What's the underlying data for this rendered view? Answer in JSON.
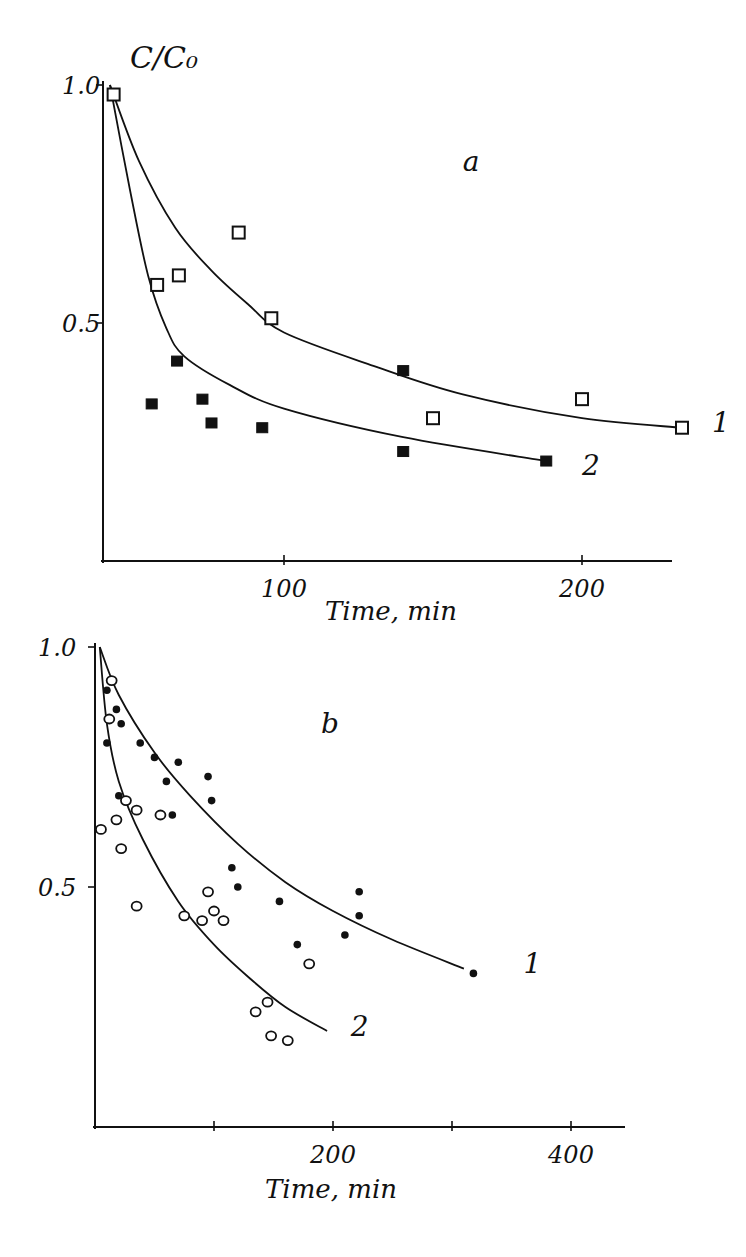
{
  "chart_data": [
    {
      "panel_label": "a",
      "type": "scatter",
      "title": "",
      "ylabel": "C/C₀",
      "xlabel": "Time, min",
      "xlim": [
        0,
        240
      ],
      "ylim": [
        0,
        1.0
      ],
      "x_ticks": [
        100,
        200
      ],
      "x_tick_labels": [
        "100",
        "200"
      ],
      "y_ticks": [
        0.5,
        1.0
      ],
      "y_tick_labels": [
        "0.5",
        "1.0"
      ],
      "grid": false,
      "series": [
        {
          "name": "1",
          "marker": "open-square",
          "points": [
            [
              6,
              0.98
            ],
            [
              30,
              0.58
            ],
            [
              42,
              0.6
            ],
            [
              75,
              0.69
            ],
            [
              93,
              0.51
            ],
            [
              150,
              0.3
            ],
            [
              200,
              0.34
            ],
            [
              240,
              0.28
            ]
          ],
          "fit_curve": [
            [
              4,
              1.0
            ],
            [
              20,
              0.84
            ],
            [
              40,
              0.7
            ],
            [
              60,
              0.61
            ],
            [
              80,
              0.54
            ],
            [
              100,
              0.48
            ],
            [
              130,
              0.41
            ],
            [
              160,
              0.35
            ],
            [
              200,
              0.3
            ],
            [
              240,
              0.28
            ]
          ]
        },
        {
          "name": "2",
          "marker": "filled-square",
          "points": [
            [
              27,
              0.33
            ],
            [
              41,
              0.42
            ],
            [
              55,
              0.34
            ],
            [
              60,
              0.29
            ],
            [
              88,
              0.28
            ],
            [
              140,
              0.4
            ],
            [
              140,
              0.23
            ],
            [
              188,
              0.21
            ]
          ],
          "fit_curve": [
            [
              4,
              1.0
            ],
            [
              15,
              0.78
            ],
            [
              25,
              0.6
            ],
            [
              35,
              0.49
            ],
            [
              45,
              0.43
            ],
            [
              70,
              0.37
            ],
            [
              100,
              0.32
            ],
            [
              140,
              0.26
            ],
            [
              188,
              0.21
            ]
          ]
        }
      ],
      "annotations": [
        {
          "text": "a",
          "at": [
            160,
            0.82
          ]
        },
        {
          "text": "1",
          "at": [
            252,
            0.27
          ]
        },
        {
          "text": "2",
          "at": [
            200,
            0.18
          ]
        }
      ]
    },
    {
      "panel_label": "b",
      "type": "scatter",
      "title": "",
      "ylabel": "",
      "xlabel": "Time, min",
      "xlim": [
        0,
        440
      ],
      "ylim": [
        0,
        1.0
      ],
      "x_ticks": [
        100,
        200,
        300,
        400
      ],
      "x_tick_labels": [
        "",
        "200",
        "",
        "400"
      ],
      "y_ticks": [
        0.5,
        1.0
      ],
      "y_tick_labels": [
        "0.5",
        "1.0"
      ],
      "grid": false,
      "series": [
        {
          "name": "1",
          "marker": "filled-circle",
          "points": [
            [
              10,
              0.91
            ],
            [
              18,
              0.87
            ],
            [
              22,
              0.84
            ],
            [
              10,
              0.8
            ],
            [
              38,
              0.8
            ],
            [
              50,
              0.77
            ],
            [
              60,
              0.72
            ],
            [
              70,
              0.76
            ],
            [
              95,
              0.73
            ],
            [
              98,
              0.68
            ],
            [
              20,
              0.69
            ],
            [
              65,
              0.65
            ],
            [
              115,
              0.54
            ],
            [
              120,
              0.5
            ],
            [
              155,
              0.47
            ],
            [
              170,
              0.38
            ],
            [
              210,
              0.4
            ],
            [
              222,
              0.49
            ],
            [
              222,
              0.44
            ],
            [
              318,
              0.32
            ]
          ],
          "fit_curve": [
            [
              4,
              1.0
            ],
            [
              20,
              0.9
            ],
            [
              50,
              0.78
            ],
            [
              80,
              0.69
            ],
            [
              120,
              0.59
            ],
            [
              160,
              0.51
            ],
            [
              200,
              0.45
            ],
            [
              250,
              0.39
            ],
            [
              310,
              0.33
            ]
          ]
        },
        {
          "name": "2",
          "marker": "open-circle",
          "points": [
            [
              14,
              0.93
            ],
            [
              12,
              0.85
            ],
            [
              5,
              0.62
            ],
            [
              18,
              0.64
            ],
            [
              26,
              0.68
            ],
            [
              35,
              0.66
            ],
            [
              55,
              0.65
            ],
            [
              22,
              0.58
            ],
            [
              35,
              0.46
            ],
            [
              75,
              0.44
            ],
            [
              90,
              0.43
            ],
            [
              95,
              0.49
            ],
            [
              100,
              0.45
            ],
            [
              108,
              0.43
            ],
            [
              180,
              0.34
            ],
            [
              135,
              0.24
            ],
            [
              145,
              0.26
            ],
            [
              148,
              0.19
            ],
            [
              162,
              0.18
            ]
          ],
          "fit_curve": [
            [
              4,
              1.0
            ],
            [
              10,
              0.84
            ],
            [
              20,
              0.72
            ],
            [
              40,
              0.6
            ],
            [
              70,
              0.47
            ],
            [
              100,
              0.38
            ],
            [
              130,
              0.31
            ],
            [
              160,
              0.25
            ],
            [
              195,
              0.2
            ]
          ]
        }
      ],
      "annotations": [
        {
          "text": "b",
          "at": [
            190,
            0.82
          ]
        },
        {
          "text": "1",
          "at": [
            360,
            0.32
          ]
        },
        {
          "text": "2",
          "at": [
            215,
            0.19
          ]
        }
      ]
    }
  ]
}
